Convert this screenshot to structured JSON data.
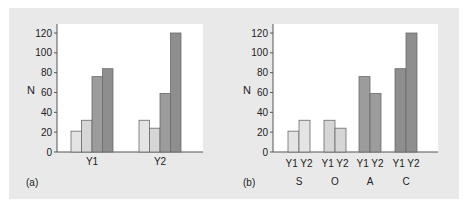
{
  "chart_data": [
    {
      "panel": "(a)",
      "type": "bar",
      "title": "",
      "xlabel": "",
      "ylabel": "N",
      "ylim": [
        0,
        120
      ],
      "yticks": [
        0,
        20,
        40,
        60,
        80,
        100,
        120
      ],
      "categories": [
        "Y1",
        "Y2"
      ],
      "series": [
        {
          "name": "S",
          "color": "#e4e4e4",
          "values": [
            21,
            32
          ]
        },
        {
          "name": "O",
          "color": "#d6d6d6",
          "values": [
            32,
            24
          ]
        },
        {
          "name": "A",
          "color": "#9c9c9c",
          "values": [
            76,
            59
          ]
        },
        {
          "name": "C",
          "color": "#8e8e8e",
          "values": [
            84,
            120
          ]
        }
      ],
      "grid": false,
      "legend": "none"
    },
    {
      "panel": "(b)",
      "type": "bar",
      "title": "",
      "xlabel": "",
      "ylabel": "N",
      "ylim": [
        0,
        120
      ],
      "yticks": [
        0,
        20,
        40,
        60,
        80,
        100,
        120
      ],
      "groups": [
        "S",
        "O",
        "A",
        "C"
      ],
      "subcategories": [
        "Y1",
        "Y2"
      ],
      "series": [
        {
          "name": "Y1",
          "values": [
            21,
            32,
            76,
            84
          ]
        },
        {
          "name": "Y2",
          "values": [
            32,
            24,
            59,
            120
          ]
        }
      ],
      "group_colors": [
        "#e4e4e4",
        "#d6d6d6",
        "#9c9c9c",
        "#8e8e8e"
      ],
      "grid": false,
      "legend": "none"
    }
  ],
  "labels": {
    "panel_a": "(a)",
    "panel_b": "(b)",
    "y_axis_title": "N",
    "y_ticks": [
      "0",
      "20",
      "40",
      "60",
      "80",
      "100",
      "120"
    ],
    "a_categories": [
      "Y1",
      "Y2"
    ],
    "b_sub": [
      "Y1 Y2",
      "Y1 Y2",
      "Y1 Y2",
      "Y1 Y2"
    ],
    "b_groups": [
      "S",
      "O",
      "A",
      "C"
    ]
  }
}
